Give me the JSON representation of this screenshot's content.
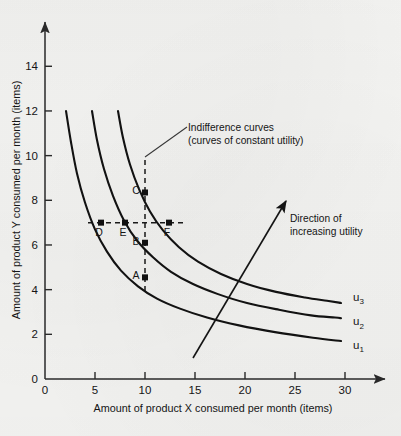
{
  "chart_data": {
    "type": "line",
    "title": "",
    "xlabel": "Amount of product X consumed per month (items)",
    "ylabel": "Amount of product Y consumed per month (items)",
    "xlim": [
      0,
      33
    ],
    "ylim": [
      0,
      15.5
    ],
    "xticks": [
      0,
      5,
      10,
      15,
      20,
      25,
      30
    ],
    "xticklabels": [
      "0",
      "5",
      "10",
      "15",
      "20",
      "25",
      "30"
    ],
    "yticks": [
      0,
      2,
      4,
      6,
      8,
      10,
      12,
      14
    ],
    "yticklabels": [
      "0",
      "2",
      "4",
      "6",
      "8",
      "10",
      "12",
      "14"
    ],
    "grid": false,
    "legend": "none",
    "series": [
      {
        "name": "u1",
        "label": "u",
        "sub": "1",
        "label_x": 30.8,
        "label_y": 1.35,
        "x": [
          2.1,
          2.6,
          3.2,
          4.0,
          5.0,
          6.2,
          7.6,
          9.3,
          11.2,
          13.5,
          16.2,
          19.4,
          23.0,
          26.8,
          29.6
        ],
        "y": [
          12.0,
          10.6,
          9.2,
          7.9,
          6.7,
          5.7,
          4.85,
          4.15,
          3.6,
          3.15,
          2.75,
          2.4,
          2.1,
          1.85,
          1.7
        ]
      },
      {
        "name": "u2",
        "label": "u",
        "sub": "2",
        "label_x": 30.8,
        "label_y": 2.4,
        "x": [
          4.7,
          5.2,
          5.9,
          6.8,
          7.9,
          9.2,
          10.8,
          12.6,
          14.8,
          17.3,
          20.2,
          23.4,
          26.6,
          29.0,
          29.6
        ],
        "y": [
          12.0,
          10.7,
          9.4,
          8.2,
          7.1,
          6.2,
          5.45,
          4.8,
          4.25,
          3.8,
          3.4,
          3.1,
          2.85,
          2.75,
          2.72
        ]
      },
      {
        "name": "u3",
        "label": "u",
        "sub": "3",
        "label_x": 30.8,
        "label_y": 3.5,
        "x": [
          7.3,
          7.8,
          8.5,
          9.4,
          10.5,
          11.8,
          13.4,
          15.3,
          17.6,
          20.2,
          23.1,
          26.0,
          28.2,
          29.4,
          29.6
        ],
        "y": [
          12.0,
          10.8,
          9.6,
          8.5,
          7.5,
          6.65,
          5.9,
          5.25,
          4.7,
          4.25,
          3.9,
          3.65,
          3.5,
          3.42,
          3.4
        ]
      }
    ],
    "points": [
      {
        "name": "A",
        "x": 10.0,
        "y": 4.55,
        "curve": "u1",
        "label_dx": -9,
        "label_dy": 2
      },
      {
        "name": "B",
        "x": 10.0,
        "y": 6.1,
        "curve": "u2",
        "label_dx": -9,
        "label_dy": 2
      },
      {
        "name": "C",
        "x": 10.0,
        "y": 8.35,
        "curve": "u3",
        "label_dx": -9,
        "label_dy": 2
      },
      {
        "name": "D",
        "x": 5.6,
        "y": 7.0,
        "curve": "u1",
        "label_dx": -2,
        "label_dy": 13
      },
      {
        "name": "E",
        "x": 8.0,
        "y": 7.0,
        "curve": "u2",
        "label_dx": -2,
        "label_dy": 13
      },
      {
        "name": "F",
        "x": 12.4,
        "y": 7.0,
        "curve": "u3",
        "label_dx": -2,
        "label_dy": 13
      }
    ],
    "guides": {
      "vertical": {
        "x": 10.0,
        "y_from": 3.9,
        "y_to": 9.8
      },
      "horizontal": {
        "y": 7.0,
        "x_from": 4.3,
        "x_to": 13.8
      }
    },
    "annotations": [
      {
        "name": "indifference-curves-note",
        "lines": [
          "Indifference curves",
          "(curves of constant utility)"
        ],
        "text_x": 188,
        "text_y": 131,
        "leader_from": [
          145,
          157
        ],
        "leader_to": [
          187,
          127
        ]
      },
      {
        "name": "direction-of-increasing-utility-note",
        "lines": [
          "Direction of",
          "increasing utility"
        ],
        "text_x": 290,
        "text_y": 222,
        "arrow_from": [
          193,
          358
        ],
        "arrow_to": [
          286,
          201
        ]
      }
    ]
  }
}
